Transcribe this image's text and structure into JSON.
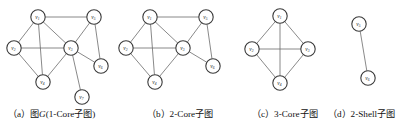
{
  "figure": {
    "panels": [
      {
        "id": "a",
        "caption_prefix": "（a）",
        "caption_text_1": "图",
        "caption_italic": "G",
        "caption_text_2": "(1-Core子图)",
        "caption_full": "（a）图G(1-Core子图)",
        "nodes": [
          {
            "id": "v1",
            "label": "v",
            "sub": "1",
            "x": 38,
            "y": 17
          },
          {
            "id": "v2",
            "label": "v",
            "sub": "2",
            "x": 14,
            "y": 48
          },
          {
            "id": "v3",
            "label": "v",
            "sub": "3",
            "x": 71,
            "y": 48
          },
          {
            "id": "v4",
            "label": "v",
            "sub": "4",
            "x": 43,
            "y": 82
          },
          {
            "id": "v5",
            "label": "v",
            "sub": "5",
            "x": 94,
            "y": 17
          },
          {
            "id": "v6",
            "label": "v",
            "sub": "6",
            "x": 101,
            "y": 66
          },
          {
            "id": "v7",
            "label": "v",
            "sub": "7",
            "x": 82,
            "y": 97
          }
        ],
        "edges": [
          [
            "v1",
            "v2"
          ],
          [
            "v1",
            "v3"
          ],
          [
            "v1",
            "v4"
          ],
          [
            "v1",
            "v5"
          ],
          [
            "v2",
            "v3"
          ],
          [
            "v2",
            "v4"
          ],
          [
            "v3",
            "v4"
          ],
          [
            "v3",
            "v5"
          ],
          [
            "v3",
            "v6"
          ],
          [
            "v3",
            "v7"
          ],
          [
            "v5",
            "v6"
          ]
        ]
      },
      {
        "id": "b",
        "caption_prefix": "（b）",
        "caption_text_1": "2-Core子图",
        "caption_full": "（b）2-Core子图",
        "nodes": [
          {
            "id": "v1",
            "label": "v",
            "sub": "1",
            "x": 38,
            "y": 17
          },
          {
            "id": "v2",
            "label": "v",
            "sub": "2",
            "x": 14,
            "y": 48
          },
          {
            "id": "v3",
            "label": "v",
            "sub": "3",
            "x": 71,
            "y": 48
          },
          {
            "id": "v4",
            "label": "v",
            "sub": "4",
            "x": 43,
            "y": 82
          },
          {
            "id": "v5",
            "label": "v",
            "sub": "5",
            "x": 94,
            "y": 17
          },
          {
            "id": "v6",
            "label": "v",
            "sub": "6",
            "x": 101,
            "y": 66
          }
        ],
        "edges": [
          [
            "v1",
            "v2"
          ],
          [
            "v1",
            "v3"
          ],
          [
            "v1",
            "v4"
          ],
          [
            "v1",
            "v5"
          ],
          [
            "v2",
            "v3"
          ],
          [
            "v2",
            "v4"
          ],
          [
            "v3",
            "v4"
          ],
          [
            "v3",
            "v5"
          ],
          [
            "v3",
            "v6"
          ],
          [
            "v5",
            "v6"
          ]
        ]
      },
      {
        "id": "c",
        "caption_prefix": "（c）",
        "caption_text_1": "3-Core子图",
        "caption_full": "（c）3-Core子图",
        "nodes": [
          {
            "id": "v1",
            "label": "v",
            "sub": "1",
            "x": 40,
            "y": 16
          },
          {
            "id": "v2",
            "label": "v",
            "sub": "2",
            "x": 12,
            "y": 49
          },
          {
            "id": "v3",
            "label": "v",
            "sub": "3",
            "x": 68,
            "y": 49
          },
          {
            "id": "v4",
            "label": "v",
            "sub": "4",
            "x": 40,
            "y": 83
          }
        ],
        "edges": [
          [
            "v1",
            "v2"
          ],
          [
            "v1",
            "v3"
          ],
          [
            "v1",
            "v4"
          ],
          [
            "v2",
            "v3"
          ],
          [
            "v2",
            "v4"
          ],
          [
            "v3",
            "v4"
          ]
        ]
      },
      {
        "id": "d",
        "caption_prefix": "（d）",
        "caption_text_1": "2-Shell子图",
        "caption_full": "（d）2-Shell子图",
        "nodes": [
          {
            "id": "v5",
            "label": "v",
            "sub": "5",
            "x": 29,
            "y": 24
          },
          {
            "id": "v6",
            "label": "v",
            "sub": "6",
            "x": 38,
            "y": 78
          }
        ],
        "edges": [
          [
            "v5",
            "v6"
          ]
        ]
      }
    ],
    "style": {
      "node_radius": 7.2,
      "node_fill": "#ffffff",
      "node_stroke": "#3a3a3a",
      "edge_color": "#6b6b6b",
      "background": "#ffffff",
      "text_color": "#111111"
    }
  }
}
